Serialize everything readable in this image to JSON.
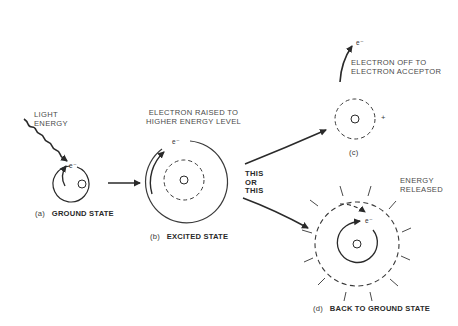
{
  "diagram": {
    "type": "photoexcitation of an electron",
    "colors": {
      "ink": "#2a2a2a",
      "background": "#ffffff"
    },
    "panels": [
      {
        "id": "a",
        "caption_letter": "(a)",
        "caption_title": "GROUND STATE",
        "annotation": [
          "LIGHT",
          "ENERGY"
        ],
        "electron_label": "e⁻"
      },
      {
        "id": "b",
        "caption_letter": "(b)",
        "caption_title": "EXCITED STATE",
        "annotation": [
          "ELECTRON RAISED TO",
          "HIGHER ENERGY LEVEL"
        ],
        "electron_label": "e⁻"
      },
      {
        "id": "c",
        "caption_letter": "(c)",
        "caption_title": "",
        "annotation": [
          "ELECTRON OFF TO",
          "ELECTRON ACCEPTOR"
        ],
        "electron_label": "e⁻",
        "charge": "+"
      },
      {
        "id": "d",
        "caption_letter": "(d)",
        "caption_title": "BACK TO GROUND STATE",
        "annotation": [
          "ENERGY",
          "RELEASED"
        ],
        "electron_label": "e⁻"
      }
    ],
    "branch_label": [
      "THIS",
      "OR",
      "THIS"
    ]
  }
}
